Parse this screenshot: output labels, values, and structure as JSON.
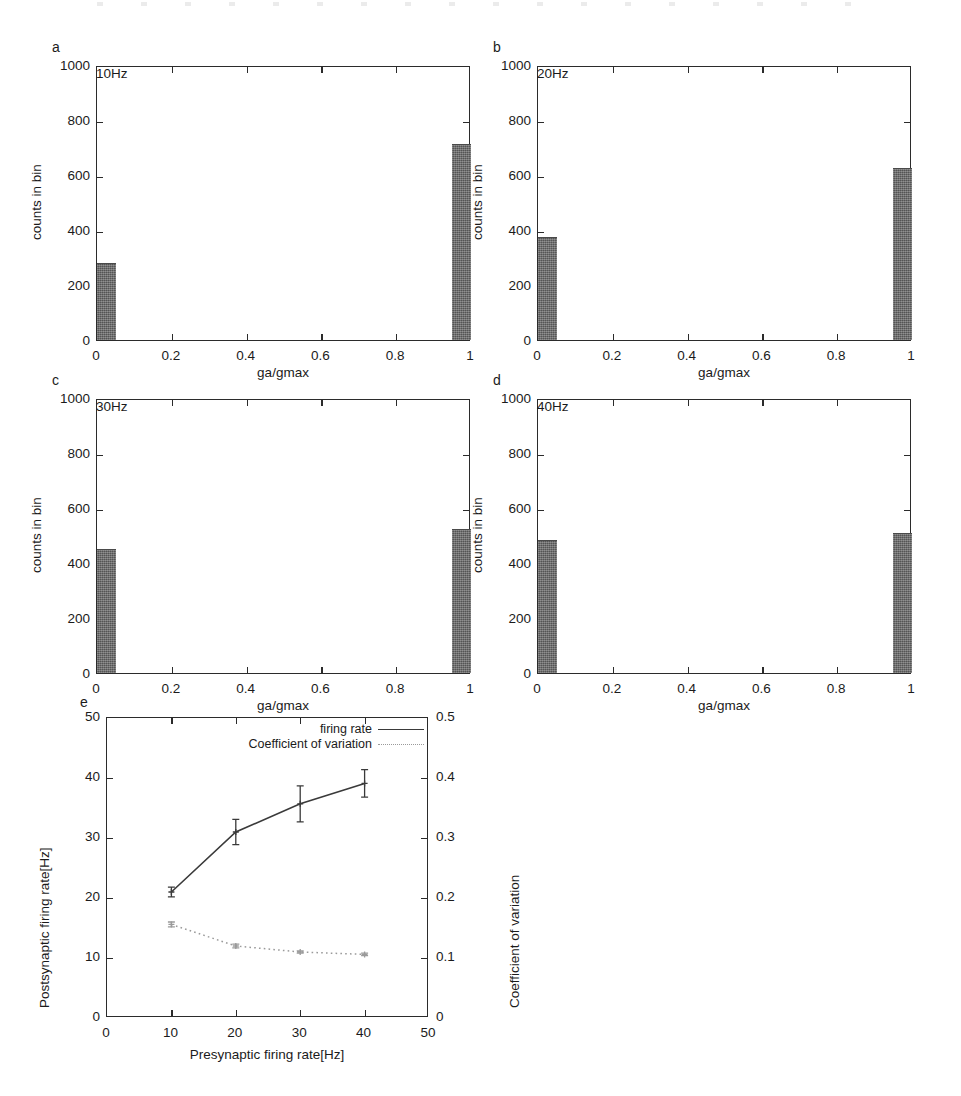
{
  "figure": {
    "panels": [
      {
        "letter": "a",
        "freq_label": "10Hz",
        "xlabel": "ga/gmax",
        "ylabel": "counts in bin",
        "xticks": [
          "0",
          "0.2",
          "0.4",
          "0.6",
          "0.8",
          "1"
        ],
        "yticks": [
          "0",
          "200",
          "400",
          "600",
          "800",
          "1000"
        ]
      },
      {
        "letter": "b",
        "freq_label": "20Hz",
        "xlabel": "ga/gmax",
        "ylabel": "counts in bin",
        "xticks": [
          "0",
          "0.2",
          "0.4",
          "0.6",
          "0.8",
          "1"
        ],
        "yticks": [
          "0",
          "200",
          "400",
          "600",
          "800",
          "1000"
        ]
      },
      {
        "letter": "c",
        "freq_label": "30Hz",
        "xlabel": "ga/gmax",
        "ylabel": "counts in bin",
        "xticks": [
          "0",
          "0.2",
          "0.4",
          "0.6",
          "0.8",
          "1"
        ],
        "yticks": [
          "0",
          "200",
          "400",
          "600",
          "800",
          "1000"
        ]
      },
      {
        "letter": "d",
        "freq_label": "40Hz",
        "xlabel": "ga/gmax",
        "ylabel": "counts in bin",
        "xticks": [
          "0",
          "0.2",
          "0.4",
          "0.6",
          "0.8",
          "1"
        ],
        "yticks": [
          "0",
          "200",
          "400",
          "600",
          "800",
          "1000"
        ]
      },
      {
        "letter": "e",
        "xlabel": "Presynaptic firing rate[Hz]",
        "ylabel_left": "Postsynaptic firing rate[Hz]",
        "ylabel_right": "Coefficient of variation",
        "xticks": [
          "0",
          "10",
          "20",
          "30",
          "40",
          "50"
        ],
        "yticks_left": [
          "0",
          "10",
          "20",
          "30",
          "40",
          "50"
        ],
        "yticks_right": [
          "0",
          "0.1",
          "0.2",
          "0.3",
          "0.4",
          "0.5"
        ],
        "legend": [
          {
            "label": "firing rate",
            "style": "solid"
          },
          {
            "label": "Coefficient of variation",
            "style": "dotted"
          }
        ]
      }
    ],
    "colors": {
      "bar_fill": "#676767",
      "axis": "#2b2b2b",
      "firing_rate_line": "#3a3a3a",
      "cv_line": "#9a9a9a"
    }
  },
  "chart_data": [
    {
      "type": "bar",
      "panel": "a",
      "title": "10Hz",
      "xlabel": "ga/gmax",
      "ylabel": "counts in bin",
      "xlim": [
        0,
        1
      ],
      "ylim": [
        0,
        1000
      ],
      "xticks": [
        0,
        0.2,
        0.4,
        0.6,
        0.8,
        1
      ],
      "yticks": [
        0,
        200,
        400,
        600,
        800,
        1000
      ],
      "bin_width": 0.05,
      "bin_centers": [
        0.025,
        0.975
      ],
      "values": [
        278,
        710
      ],
      "grid": false
    },
    {
      "type": "bar",
      "panel": "b",
      "title": "20Hz",
      "xlabel": "ga/gmax",
      "ylabel": "counts in bin",
      "xlim": [
        0,
        1
      ],
      "ylim": [
        0,
        1000
      ],
      "xticks": [
        0,
        0.2,
        0.4,
        0.6,
        0.8,
        1
      ],
      "yticks": [
        0,
        200,
        400,
        600,
        800,
        1000
      ],
      "bin_width": 0.05,
      "bin_centers": [
        0.025,
        0.975
      ],
      "values": [
        370,
        622
      ],
      "grid": false
    },
    {
      "type": "bar",
      "panel": "c",
      "title": "30Hz",
      "xlabel": "ga/gmax",
      "ylabel": "counts in bin",
      "xlim": [
        0,
        1
      ],
      "ylim": [
        0,
        1000
      ],
      "xticks": [
        0,
        0.2,
        0.4,
        0.6,
        0.8,
        1
      ],
      "yticks": [
        0,
        200,
        400,
        600,
        800,
        1000
      ],
      "bin_width": 0.05,
      "bin_centers": [
        0.025,
        0.975
      ],
      "values": [
        448,
        520
      ],
      "grid": false
    },
    {
      "type": "bar",
      "panel": "d",
      "title": "40Hz",
      "xlabel": "ga/gmax",
      "ylabel": "counts in bin",
      "xlim": [
        0,
        1
      ],
      "ylim": [
        0,
        1000
      ],
      "xticks": [
        0,
        0.2,
        0.4,
        0.6,
        0.8,
        1
      ],
      "yticks": [
        0,
        200,
        400,
        600,
        800,
        1000
      ],
      "bin_width": 0.05,
      "bin_centers": [
        0.025,
        0.975
      ],
      "values": [
        480,
        505
      ],
      "grid": false
    },
    {
      "type": "line",
      "panel": "e",
      "xlabel": "Presynaptic firing rate[Hz]",
      "ylabel": "Postsynaptic firing rate[Hz]",
      "ylabel_right": "Coefficient of variation",
      "x": [
        10,
        20,
        30,
        40
      ],
      "xlim": [
        0,
        50
      ],
      "ylim": [
        0,
        50
      ],
      "ylim_right": [
        0,
        0.5
      ],
      "xticks": [
        0,
        10,
        20,
        30,
        40,
        50
      ],
      "yticks": [
        0,
        10,
        20,
        30,
        40,
        50
      ],
      "yticks_right": [
        0,
        0.1,
        0.2,
        0.3,
        0.4,
        0.5
      ],
      "legend_position": "top-right",
      "grid": false,
      "series": [
        {
          "name": "firing rate",
          "axis": "left",
          "style": "solid",
          "values": [
            21.0,
            31.0,
            35.7,
            39.1
          ],
          "errors": [
            0.8,
            2.1,
            3.0,
            2.3
          ]
        },
        {
          "name": "Coefficient of variation",
          "axis": "right",
          "style": "dotted",
          "values": [
            0.156,
            0.12,
            0.11,
            0.106
          ],
          "errors": [
            0.004,
            0.003,
            0.002,
            0.002
          ]
        }
      ]
    }
  ]
}
